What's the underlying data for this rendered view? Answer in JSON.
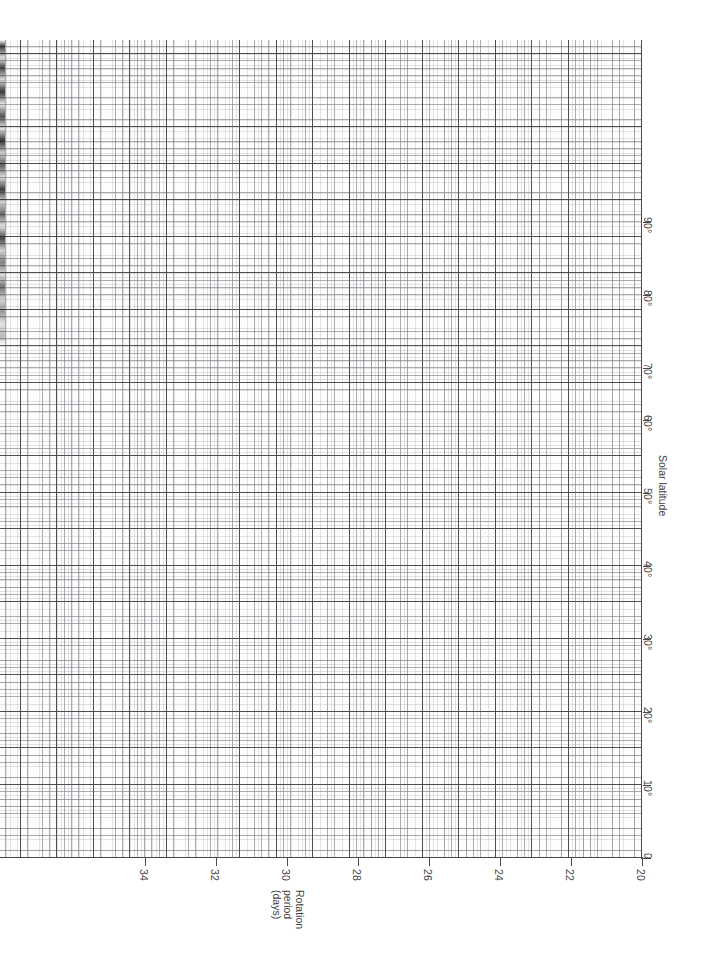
{
  "chart_data": {
    "type": "line",
    "title": "",
    "subtitle": "",
    "orientation": "rotated-90",
    "grid": "graph-paper",
    "grid_major_units": {
      "rotation_period_days": 1,
      "solar_latitude_deg": 5
    },
    "grid_minor_subdivisions": 5,
    "legend": "none",
    "annotations": [],
    "series": [],
    "x": {
      "label": "Solar latitude",
      "unit": "degrees",
      "ticks": [
        0,
        10,
        20,
        30,
        40,
        50,
        60,
        70,
        80,
        90
      ],
      "tick_labels": [
        "0",
        "10°",
        "20°",
        "30°",
        "40°",
        "50°",
        "60°",
        "70°",
        "80°",
        "90°"
      ],
      "lim": [
        0,
        112
      ],
      "direction": "bottom-to-top"
    },
    "y": {
      "label": "Rotation period (days)",
      "unit": "days",
      "ticks": [
        20,
        22,
        24,
        26,
        28,
        30,
        32,
        34
      ],
      "tick_labels": [
        "20",
        "22",
        "24",
        "26",
        "28",
        "30",
        "32",
        "34"
      ],
      "lim": [
        20,
        38
      ],
      "direction": "right-to-left"
    }
  },
  "axes": {
    "rotation": {
      "title_lines": [
        "Rotation",
        "period",
        "(days)"
      ],
      "ticks": [
        {
          "label": "34",
          "value": 34,
          "x": 145
        },
        {
          "label": "32",
          "value": 32,
          "x": 216
        },
        {
          "label": "30",
          "value": 30,
          "x": 287
        },
        {
          "label": "28",
          "value": 28,
          "x": 358
        },
        {
          "label": "26",
          "value": 26,
          "x": 429
        },
        {
          "label": "24",
          "value": 24,
          "x": 500
        },
        {
          "label": "22",
          "value": 22,
          "x": 571
        },
        {
          "label": "20",
          "value": 20,
          "x": 642
        }
      ]
    },
    "latitude": {
      "title": "Solar latitude",
      "ticks": [
        {
          "label": "90°",
          "value": 90,
          "y": 222
        },
        {
          "label": "80°",
          "value": 80,
          "y": 295
        },
        {
          "label": "70°",
          "value": 70,
          "y": 368
        },
        {
          "label": "60°",
          "value": 60,
          "y": 420
        },
        {
          "label": "50°",
          "value": 50,
          "y": 493
        },
        {
          "label": "40°",
          "value": 40,
          "y": 566
        },
        {
          "label": "30°",
          "value": 30,
          "y": 639
        },
        {
          "label": "20°",
          "value": 20,
          "y": 712
        },
        {
          "label": "10°",
          "value": 10,
          "y": 785
        },
        {
          "label": "0",
          "value": 0,
          "y": 858
        }
      ]
    }
  },
  "colors": {
    "paper": "#ffffff",
    "grid_major": "#46464a",
    "grid_minor": "#787a80",
    "axis_line": "#4a4a4c",
    "text": "#434345"
  }
}
